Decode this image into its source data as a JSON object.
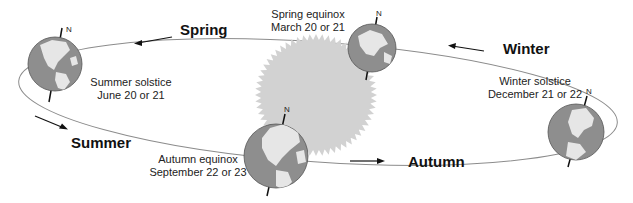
{
  "diagram": {
    "colors": {
      "orbit": "#8c8c8c",
      "sun": "#d2d2d2",
      "globe_ocean": "#8e8e8e",
      "globe_land": "#e6e6e6",
      "axis": "#111111",
      "arrow": "#111111",
      "text": "#222222"
    },
    "sun": {
      "label": ""
    },
    "positions": [
      {
        "id": "summer-solstice",
        "event": "Summer solstice",
        "date": "June 20 or 21",
        "north_label": "N"
      },
      {
        "id": "spring-equinox",
        "event": "Spring equinox",
        "date": "March 20 or 21",
        "north_label": "N"
      },
      {
        "id": "autumn-equinox",
        "event": "Autumn equinox",
        "date": "September 22 or 23",
        "north_label": "N"
      },
      {
        "id": "winter-solstice",
        "event": "Winter solstice",
        "date": "December 21 or 22",
        "north_label": "N"
      }
    ],
    "seasons": [
      {
        "id": "spring",
        "label": "Spring",
        "arrow_direction": "left"
      },
      {
        "id": "summer",
        "label": "Summer",
        "arrow_direction": "right"
      },
      {
        "id": "autumn",
        "label": "Autumn",
        "arrow_direction": "right"
      },
      {
        "id": "winter",
        "label": "Winter",
        "arrow_direction": "left"
      }
    ]
  }
}
